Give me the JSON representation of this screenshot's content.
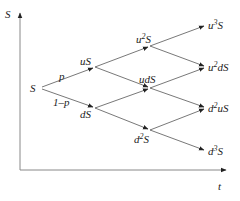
{
  "diagram": {
    "type": "binomial-tree",
    "axes": {
      "y_label": "S",
      "x_label": "t"
    },
    "branch_labels": {
      "up": "p",
      "down": "1–p"
    },
    "nodes": [
      {
        "id": "S",
        "label": "S",
        "sup": "",
        "pre": "",
        "post": "",
        "x": 40,
        "y": 88
      },
      {
        "id": "uS",
        "label": "uS",
        "sup": "",
        "pre": "",
        "post": "",
        "x": 95,
        "y": 67
      },
      {
        "id": "dS",
        "label": "dS",
        "sup": "",
        "pre": "",
        "post": "",
        "x": 95,
        "y": 108
      },
      {
        "id": "u2S",
        "label": "u2S",
        "sup": "2",
        "pre": "u",
        "post": "S",
        "x": 150,
        "y": 46
      },
      {
        "id": "udS",
        "label": "udS",
        "sup": "",
        "pre": "",
        "post": "",
        "x": 150,
        "y": 88
      },
      {
        "id": "d2S",
        "label": "d2S",
        "sup": "2",
        "pre": "d",
        "post": "S",
        "x": 150,
        "y": 130
      },
      {
        "id": "u3S",
        "label": "u3S",
        "sup": "3",
        "pre": "u",
        "post": "S",
        "x": 206,
        "y": 25
      },
      {
        "id": "u2dS",
        "label": "u2dS",
        "sup": "2",
        "pre": "u",
        "post": "dS",
        "x": 206,
        "y": 67
      },
      {
        "id": "d2uS",
        "label": "d2uS",
        "sup": "2",
        "pre": "d",
        "post": "uS",
        "x": 206,
        "y": 108
      },
      {
        "id": "d3S",
        "label": "d3S",
        "sup": "3",
        "pre": "d",
        "post": "S",
        "x": 206,
        "y": 151
      }
    ],
    "edges": [
      {
        "from": "S",
        "to": "uS"
      },
      {
        "from": "S",
        "to": "dS"
      },
      {
        "from": "uS",
        "to": "u2S"
      },
      {
        "from": "uS",
        "to": "udS"
      },
      {
        "from": "dS",
        "to": "udS"
      },
      {
        "from": "dS",
        "to": "d2S"
      },
      {
        "from": "u2S",
        "to": "u3S"
      },
      {
        "from": "u2S",
        "to": "u2dS"
      },
      {
        "from": "udS",
        "to": "u2dS"
      },
      {
        "from": "udS",
        "to": "d2uS"
      },
      {
        "from": "d2S",
        "to": "d2uS"
      },
      {
        "from": "d2S",
        "to": "d3S"
      }
    ],
    "text": {
      "S_root": "S",
      "uS": "uS",
      "dS": "dS",
      "udS": "udS",
      "u": "u",
      "d": "d",
      "S": "S",
      "dS_tail": "dS",
      "uS_tail": "uS",
      "sup2": "2",
      "sup3": "3"
    }
  }
}
